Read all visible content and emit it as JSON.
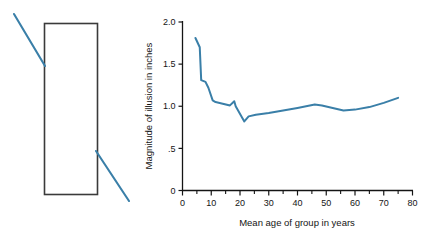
{
  "figure": {
    "name": "poggendorff-illusion-and-age-graph",
    "illusion_panel": {
      "name": "poggendorff-figure",
      "rectangle": {
        "x": 44,
        "y": 23,
        "width": 53,
        "height": 171,
        "stroke": "#3a3a3a"
      },
      "oblique_lines": [
        {
          "name": "upper-left-oblique",
          "x1": 14,
          "y1": 14,
          "x2": 45,
          "y2": 66
        },
        {
          "name": "lower-right-oblique",
          "x1": 96,
          "y1": 151,
          "x2": 129,
          "y2": 201
        }
      ],
      "line_color": "#3a7fa8"
    }
  },
  "chart_data": {
    "type": "line",
    "title": "",
    "xlabel": "Mean age of group in years",
    "ylabel": "Magnitude of illusion in inches",
    "xlim": [
      0,
      80
    ],
    "ylim": [
      0,
      2.0
    ],
    "grid": false,
    "legend": "none",
    "line_color": "#3a7fa8",
    "axis_color": "#141414",
    "xticks": [
      0,
      10,
      20,
      30,
      40,
      50,
      60,
      70,
      80
    ],
    "xtick_labels": [
      "0",
      "10",
      "20",
      "30",
      "40",
      "50",
      "60",
      "70",
      "80"
    ],
    "xminor_ticks": [
      5,
      15,
      25,
      35,
      45,
      55,
      65,
      75
    ],
    "yticks": [
      0,
      0.5,
      1.0,
      1.5,
      2.0
    ],
    "ytick_labels": [
      "0",
      ".5",
      "1.0",
      "1.5",
      "2.0"
    ],
    "x": [
      4.5,
      6.0,
      6.5,
      8.0,
      9.0,
      10.5,
      11.5,
      14.0,
      16.5,
      18.0,
      18.5,
      21.5,
      23.0,
      25.5,
      30.0,
      35.0,
      40.0,
      46.0,
      48.5,
      56.0,
      60.0,
      65.0,
      70.0,
      75.0
    ],
    "y": [
      1.81,
      1.7,
      1.31,
      1.29,
      1.22,
      1.07,
      1.05,
      1.03,
      1.01,
      1.06,
      1.0,
      0.82,
      0.88,
      0.9,
      0.92,
      0.95,
      0.98,
      1.02,
      1.01,
      0.95,
      0.96,
      0.99,
      1.04,
      1.1
    ],
    "series": [
      {
        "name": "magnitude-of-illusion",
        "values": [
          1.81,
          1.7,
          1.31,
          1.29,
          1.22,
          1.07,
          1.05,
          1.03,
          1.01,
          1.06,
          1.0,
          0.82,
          0.88,
          0.9,
          0.92,
          0.95,
          0.98,
          1.02,
          1.01,
          0.95,
          0.96,
          0.99,
          1.04,
          1.1
        ]
      }
    ]
  }
}
